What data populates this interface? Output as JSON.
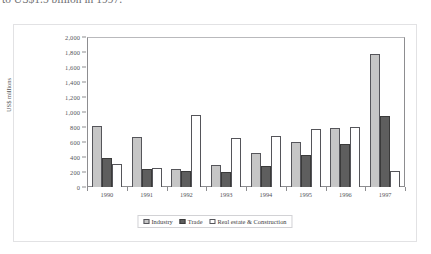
{
  "caption": {
    "text": "to US$1.5 billion in 1997."
  },
  "chart_data": {
    "type": "bar",
    "title": "",
    "subtitle": "",
    "xlabel": "",
    "ylabel": "US$ millions",
    "categories": [
      "1990",
      "1991",
      "1992",
      "1993",
      "1994",
      "1995",
      "1996",
      "1997"
    ],
    "series": [
      {
        "name": "Industry",
        "color": "#c6c6c6",
        "values": [
          810,
          670,
          245,
          295,
          455,
          600,
          785,
          1780
        ]
      },
      {
        "name": "Trade",
        "color": "#5e5e5e",
        "values": [
          390,
          240,
          215,
          200,
          275,
          425,
          570,
          950
        ]
      },
      {
        "name": "Real estate & Construction",
        "color": "#ffffff",
        "values": [
          310,
          260,
          965,
          650,
          685,
          775,
          800,
          210
        ]
      }
    ],
    "ylim": [
      0,
      2000
    ],
    "ytick_values": [
      0,
      200,
      400,
      600,
      800,
      1000,
      1200,
      1400,
      1600,
      1800,
      2000
    ],
    "ytick_labels": [
      "0",
      "200",
      "400",
      "600",
      "800",
      "1,000",
      "1,200",
      "1,400",
      "1,600",
      "1,800",
      "2,000"
    ],
    "grid": false,
    "legend_position": "bottom",
    "legend_entries": [
      "Industry",
      "Trade",
      "Real estate & Construction"
    ]
  },
  "colors": {
    "axis": "#55555a",
    "frame": "#e2e2e4",
    "plot_border": "#8d8d90"
  }
}
